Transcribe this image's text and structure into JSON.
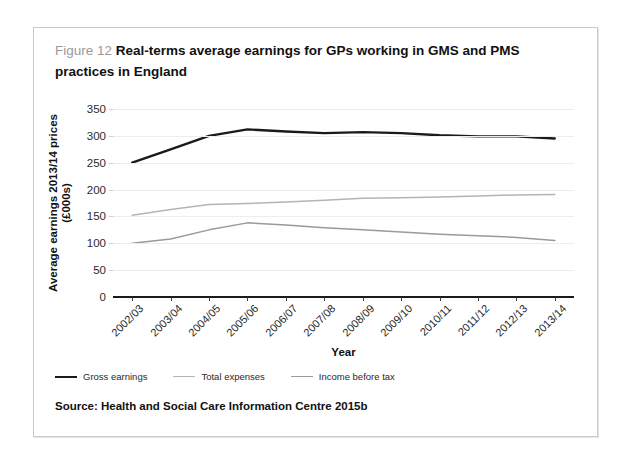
{
  "figure": {
    "number_label": "Figure 12",
    "title": "Real-terms average earnings for GPs working in GMS and PMS practices in England",
    "source": "Source: Health and Social Care Information Centre 2015b"
  },
  "chart_data": {
    "type": "line",
    "title": "Real-terms average earnings for GPs working in GMS and PMS practices in England",
    "xlabel": "Year",
    "ylabel": "Average earnings 2013/14 prices (£000s)",
    "ylim": [
      0,
      350
    ],
    "yticks": [
      0,
      50,
      100,
      150,
      200,
      250,
      300,
      350
    ],
    "grid": true,
    "legend_position": "below-left",
    "categories": [
      "2002/03",
      "2003/04",
      "2004/05",
      "2005/06",
      "2006/07",
      "2007/08",
      "2008/09",
      "2009/10",
      "2010/11",
      "2011/12",
      "2012/13",
      "2013/14"
    ],
    "series": [
      {
        "name": "Gross earnings",
        "color": "#1a1a1a",
        "width": 2.4,
        "values": [
          250,
          275,
          300,
          312,
          308,
          305,
          307,
          305,
          301,
          299,
          299,
          295
        ]
      },
      {
        "name": "Total expenses",
        "color": "#b4b4b4",
        "width": 1.5,
        "values": [
          152,
          163,
          172,
          174,
          177,
          180,
          184,
          185,
          186,
          188,
          190,
          191
        ]
      },
      {
        "name": "Income before tax",
        "color": "#9a9a9a",
        "width": 1.5,
        "values": [
          100,
          108,
          125,
          138,
          134,
          129,
          125,
          121,
          117,
          114,
          111,
          105
        ]
      }
    ]
  }
}
